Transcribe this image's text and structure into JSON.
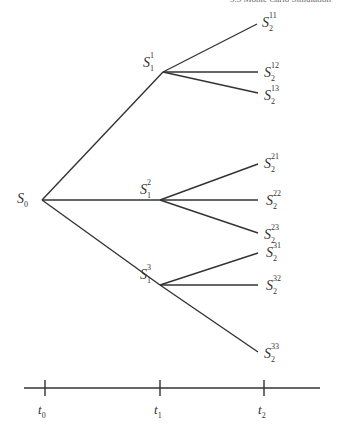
{
  "header": {
    "text": "5.5 Monte Carlo Simulation"
  },
  "tree": {
    "root": {
      "label": "S",
      "sub": "0"
    },
    "level1": [
      {
        "label": "S",
        "sub": "1",
        "sup": "1"
      },
      {
        "label": "S",
        "sub": "1",
        "sup": "2"
      },
      {
        "label": "S",
        "sub": "1",
        "sup": "3"
      }
    ],
    "level2": [
      {
        "label": "S",
        "sub": "2",
        "sup": "11"
      },
      {
        "label": "S",
        "sub": "2",
        "sup": "12"
      },
      {
        "label": "S",
        "sub": "2",
        "sup": "13"
      },
      {
        "label": "S",
        "sub": "2",
        "sup": "21"
      },
      {
        "label": "S",
        "sub": "2",
        "sup": "22"
      },
      {
        "label": "S",
        "sub": "2",
        "sup": "23"
      },
      {
        "label": "S",
        "sub": "2",
        "sup": "31"
      },
      {
        "label": "S",
        "sub": "2",
        "sup": "32"
      },
      {
        "label": "S",
        "sub": "2",
        "sup": "33"
      }
    ]
  },
  "time_axis": {
    "ticks": [
      {
        "label": "t",
        "sub": "0"
      },
      {
        "label": "t",
        "sub": "1"
      },
      {
        "label": "t",
        "sub": "2"
      }
    ]
  },
  "colors": {
    "line": "#333333",
    "text": "#333333"
  }
}
